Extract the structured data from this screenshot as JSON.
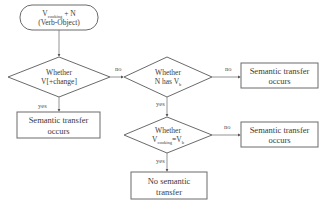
{
  "start": {
    "line1_main": "V",
    "line1_sub": "cooking",
    "line1_tail": " + N",
    "line2": "(Verb-Object)"
  },
  "decision1": {
    "line1": "Whether",
    "line2": "V[+change]",
    "yes_label": "yes",
    "no_label": "no"
  },
  "decision2": {
    "line1": "Whether",
    "line2_main": "N has V",
    "line2_sub": "b",
    "yes_label": "yes",
    "no_label": "no"
  },
  "decision3": {
    "line1": "Whether",
    "line2_main": "V",
    "line2_sub": "cooking",
    "line2_mid": "=V",
    "line2_sub2": "b",
    "yes_label": "yes",
    "no_label": "no"
  },
  "outcome1": {
    "line1": "Semantic transfer",
    "line2": "occurs"
  },
  "outcome2": {
    "line1": "Semantic transfer",
    "line2": "occurs"
  },
  "outcome3": {
    "line1": "Semantic transfer",
    "line2": "occurs"
  },
  "outcome4": {
    "line1": "No semantic",
    "line2": "transfer"
  },
  "colors": {
    "stroke": "#6a6a6a",
    "text": "#3a3a3a",
    "background": "#ffffff"
  }
}
